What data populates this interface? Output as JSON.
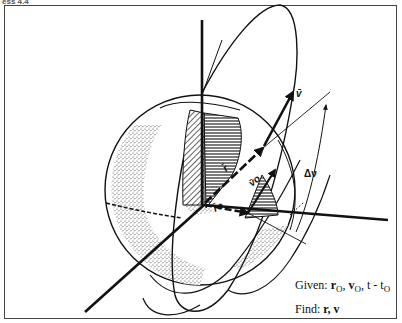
{
  "header": {
    "label": "ess 4.4"
  },
  "diagram": {
    "labels": {
      "v": "v̄",
      "r": "r̄",
      "vo": "v̄o",
      "ro": "r̄o",
      "delta_nu": "Δν"
    }
  },
  "given": {
    "prefix": "Given:",
    "r0": "r",
    "r0_sub": "O",
    "v0": "v",
    "v0_sub": "O",
    "t": ", t - t",
    "t_sub": "O"
  },
  "find": {
    "prefix": "Find:",
    "value": "r, v"
  }
}
